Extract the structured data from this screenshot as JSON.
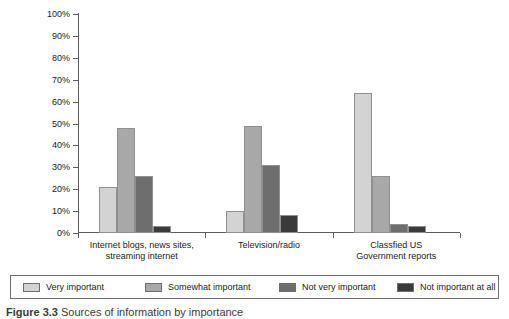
{
  "chart_data": {
    "type": "bar",
    "title": "",
    "subtitle": "",
    "xlabel": "",
    "ylabel": "",
    "ylim": [
      0,
      100
    ],
    "ytick_labels": [
      "0%",
      "10%",
      "20%",
      "30%",
      "40%",
      "50%",
      "60%",
      "70%",
      "80%",
      "90%",
      "100%"
    ],
    "ytick_values": [
      0,
      10,
      20,
      30,
      40,
      50,
      60,
      70,
      80,
      90,
      100
    ],
    "grid": false,
    "legend_position": "bottom",
    "categories": [
      "Internet blogs, news sites, streaming internet",
      "Television/radio",
      "Classfied US Government reports"
    ],
    "category_lines": [
      [
        "Internet blogs, news sites,",
        "streaming internet"
      ],
      [
        "Television/radio",
        ""
      ],
      [
        "Classfied US",
        "Government reports"
      ]
    ],
    "series": [
      {
        "name": "Very important",
        "color": "#d3d3d3",
        "values": [
          21,
          10,
          64
        ]
      },
      {
        "name": "Somewhat important",
        "color": "#a8a8a8",
        "values": [
          48,
          49,
          26
        ]
      },
      {
        "name": "Not very important",
        "color": "#6e6e6e",
        "values": [
          26,
          31,
          4
        ]
      },
      {
        "name": "Not important at all",
        "color": "#3a3a3a",
        "values": [
          3,
          8,
          3
        ]
      }
    ]
  },
  "legend": {
    "items": [
      {
        "label": "Very important"
      },
      {
        "label": "Somewhat important"
      },
      {
        "label": "Not very important"
      },
      {
        "label": "Not important at all"
      }
    ]
  },
  "caption": {
    "figure_label": "Figure 3.3",
    "text": "Sources of information by importance"
  },
  "colors": {
    "axis": "#5c5c5c",
    "bar_outline": "#8f8f8f",
    "text": "#1a1a1a"
  }
}
